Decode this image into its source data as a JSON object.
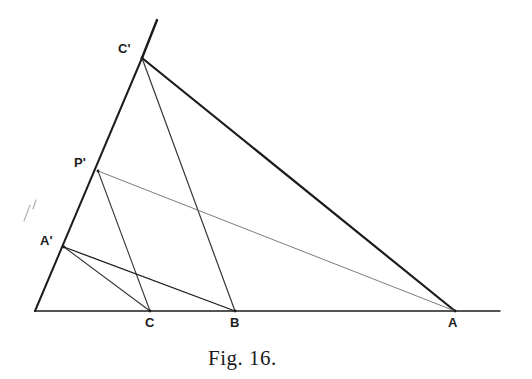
{
  "figure": {
    "caption": "Fig. 16.",
    "caption_x": 208,
    "caption_y": 348,
    "background_color": "#ffffff",
    "ink_color": "#1c1c1c",
    "faint_ink_color": "#6e6e6e",
    "width": 532,
    "height": 379
  },
  "points": [
    {
      "id": "O",
      "label": "",
      "x": 35,
      "y": 311,
      "label_x": 0,
      "label_y": 0,
      "labeled": false
    },
    {
      "id": "C",
      "label": "C",
      "x": 150,
      "y": 311,
      "label_x": 145,
      "label_y": 316,
      "labeled": true
    },
    {
      "id": "B",
      "label": "B",
      "x": 235,
      "y": 311,
      "label_x": 230,
      "label_y": 316,
      "labeled": true
    },
    {
      "id": "A",
      "label": "A",
      "x": 455,
      "y": 311,
      "label_x": 448,
      "label_y": 316,
      "labeled": true
    },
    {
      "id": "Ap",
      "label": "A'",
      "x": 64,
      "y": 247,
      "label_x": 40,
      "label_y": 234,
      "labeled": true
    },
    {
      "id": "Pp",
      "label": "P'",
      "x": 98,
      "y": 171,
      "label_x": 74,
      "label_y": 156,
      "labeled": true
    },
    {
      "id": "Cp",
      "label": "C'",
      "x": 142,
      "y": 58,
      "label_x": 118,
      "label_y": 42,
      "labeled": true
    }
  ],
  "segments": [
    {
      "name": "baseline-axis",
      "x1": 35,
      "y1": 311,
      "x2": 500,
      "y2": 311,
      "width": 1.5,
      "color": "#1c1c1c",
      "opacity": 1.0
    },
    {
      "name": "left-ray-O-to-Cp",
      "x1": 35,
      "y1": 311,
      "x2": 142,
      "y2": 58,
      "width": 2.0,
      "color": "#1c1c1c",
      "opacity": 1.0
    },
    {
      "name": "left-ray-extension",
      "x1": 142,
      "y1": 58,
      "x2": 157,
      "y2": 20,
      "width": 2.4,
      "color": "#1c1c1c",
      "opacity": 1.0
    },
    {
      "name": "Cp-to-A",
      "x1": 142,
      "y1": 58,
      "x2": 455,
      "y2": 311,
      "width": 2.2,
      "color": "#1c1c1c",
      "opacity": 1.0
    },
    {
      "name": "Cp-to-B",
      "x1": 142,
      "y1": 58,
      "x2": 235,
      "y2": 311,
      "width": 1.2,
      "color": "#2a2a2a",
      "opacity": 0.95
    },
    {
      "name": "Pp-to-A",
      "x1": 98,
      "y1": 171,
      "x2": 455,
      "y2": 311,
      "width": 1.0,
      "color": "#6e6e6e",
      "opacity": 0.9
    },
    {
      "name": "Pp-to-C",
      "x1": 98,
      "y1": 171,
      "x2": 150,
      "y2": 311,
      "width": 1.1,
      "color": "#2a2a2a",
      "opacity": 0.95
    },
    {
      "name": "Ap-to-B",
      "x1": 64,
      "y1": 247,
      "x2": 235,
      "y2": 311,
      "width": 1.3,
      "color": "#1c1c1c",
      "opacity": 1.0
    },
    {
      "name": "Ap-to-C",
      "x1": 64,
      "y1": 247,
      "x2": 150,
      "y2": 311,
      "width": 1.1,
      "color": "#2a2a2a",
      "opacity": 0.95
    }
  ],
  "artifacts": [
    {
      "name": "scan-speck-upper",
      "x1": 36,
      "y1": 200,
      "x2": 33,
      "y2": 209,
      "width": 1.2,
      "opacity": 0.55
    },
    {
      "name": "scan-speck-lower",
      "x1": 30,
      "y1": 205,
      "x2": 24,
      "y2": 221,
      "width": 1.2,
      "opacity": 0.55
    }
  ]
}
